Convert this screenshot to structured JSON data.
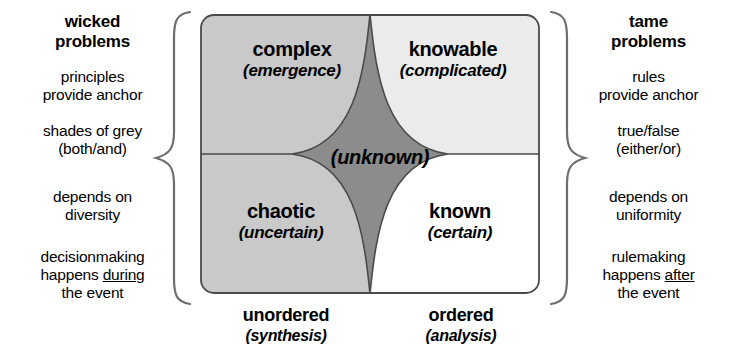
{
  "left_column": {
    "title": "wicked\nproblems",
    "title_line1": "wicked",
    "title_line2": "problems",
    "items": [
      {
        "line1": "principles",
        "line2": "provide anchor"
      },
      {
        "line1": "shades of grey",
        "line2": "(both/and)"
      },
      {
        "line1": "depends on",
        "line2": "diversity"
      },
      {
        "line1": "decisionmaking",
        "line2_pre": "happens ",
        "line2_underlined": "during",
        "line3": "the event"
      }
    ]
  },
  "right_column": {
    "title_line1": "tame",
    "title_line2": "problems",
    "items": [
      {
        "line1": "rules",
        "line2": "provide anchor"
      },
      {
        "line1": "true/false",
        "line2": "(either/or)"
      },
      {
        "line1": "depends on",
        "line2": "uniformity"
      },
      {
        "line1": "rulemaking",
        "line2_pre": "happens ",
        "line2_underlined": "after",
        "line3": "the event"
      }
    ]
  },
  "matrix": {
    "quadrants": [
      {
        "id": "complex",
        "name": "complex",
        "sub": "(emergence)",
        "fill": "#c9c9c9"
      },
      {
        "id": "knowable",
        "name": "knowable",
        "sub": "(complicated)",
        "fill": "#ebebeb"
      },
      {
        "id": "chaotic",
        "name": "chaotic",
        "sub": "(uncertain)",
        "fill": "#c9c9c9"
      },
      {
        "id": "known",
        "name": "known",
        "sub": "(certain)",
        "fill": "#ffffff"
      }
    ],
    "center": {
      "name": "(unknown)",
      "fill": "#8c8c8c"
    },
    "border_color": "#4a4a4a"
  },
  "axis": {
    "left": {
      "name": "unordered",
      "sub": "(synthesis)"
    },
    "right": {
      "name": "ordered",
      "sub": "(analysis)"
    }
  },
  "colors": {
    "brace": "#6e6e6e",
    "text": "#000000",
    "background": "#ffffff"
  }
}
